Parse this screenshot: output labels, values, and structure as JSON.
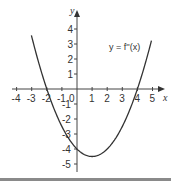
{
  "chart_data": {
    "type": "line",
    "title": "",
    "xlabel": "x",
    "ylabel": "y",
    "xlim": [
      -4,
      5
    ],
    "ylim": [
      -5,
      4
    ],
    "grid": false,
    "x_ticks": [
      -4,
      -3,
      -2,
      -1,
      0,
      1,
      2,
      3,
      4,
      5
    ],
    "y_ticks": [
      4,
      3,
      2,
      1,
      -1,
      -2,
      -3,
      -4,
      -5
    ],
    "x_tick_labels": [
      "-4",
      "-3",
      "-2",
      "-1",
      "0",
      "1",
      "2",
      "3",
      "4",
      "5"
    ],
    "y_tick_labels": [
      "4",
      "3",
      "2",
      "1",
      "-1",
      "-2",
      "-3",
      "-4",
      "-5"
    ],
    "series": [
      {
        "name": "y = f''(x)",
        "x": [
          -3,
          -2,
          -1,
          0,
          1,
          2,
          3,
          4,
          4.9
        ],
        "y": [
          3.5,
          0,
          -2.5,
          -4,
          -4.5,
          -4,
          -2.5,
          0,
          3.2
        ]
      }
    ],
    "annotations": [
      {
        "text": "y = f''(x)",
        "x": 3.3,
        "y": 2.8
      }
    ],
    "roots": [
      -2,
      4
    ],
    "minimum": {
      "x": 1,
      "y": -4.5
    }
  },
  "labels": {
    "x_axis": "x",
    "y_axis": "y",
    "curve": "y = f''(x)"
  }
}
